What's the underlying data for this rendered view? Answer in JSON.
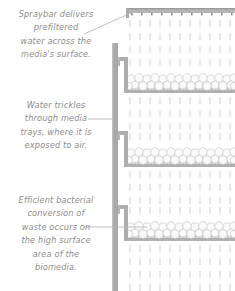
{
  "figure": {
    "background_color": "#ffffff",
    "line_color": "#a8a8a8",
    "text_color": "#8d8d8d",
    "media_fill_color": "#f2f2f2",
    "droplet_color": "#dcdcdc"
  },
  "captions": [
    {
      "id": "spraybar-caption",
      "text": "Spraybar delivers\nprefiltered\nwater across the\nmedia's surface."
    },
    {
      "id": "trickle-caption",
      "text": "Water trickles\nthrough media\ntrays, where it is\nexposed to air."
    },
    {
      "id": "bacteria-caption",
      "text": "Efficient bacterial\nconversion of\nwaste occurs on\nthe high surface\narea of the\nbiomedia."
    }
  ],
  "diagram": {
    "spraybar": {
      "label": "spraybar",
      "x": 126,
      "y": 8,
      "width": 109,
      "height": 5,
      "nozzle_count": 11
    },
    "wall": {
      "label": "vertical-wall",
      "x": 112,
      "y": 43,
      "width": 6,
      "height": 248
    },
    "trays": [
      {
        "label": "media-tray-1",
        "bracket_y": 57,
        "tray_x": 128,
        "tray_top": 64,
        "tray_bottom": 92,
        "media_rows": 2
      },
      {
        "label": "media-tray-2",
        "bracket_y": 131,
        "tray_x": 128,
        "tray_top": 138,
        "tray_bottom": 166,
        "media_rows": 2
      },
      {
        "label": "media-tray-3",
        "bracket_y": 205,
        "tray_x": 128,
        "tray_top": 212,
        "tray_bottom": 240,
        "media_rows": 2
      }
    ],
    "water_droplets": {
      "label": "water-droplets",
      "column_spacing": 10.2,
      "row_spacing": 13.5,
      "dash_length": 7,
      "dash_width": 1.3
    },
    "leaders": [
      {
        "label": "leader-spraybar",
        "type": "diagonal",
        "x1": 85,
        "y1": 33,
        "x2": 130,
        "y2": 13
      },
      {
        "label": "leader-trickle",
        "type": "horizontal",
        "x1": 88,
        "y1": 119,
        "x2": 116,
        "y2": 119
      },
      {
        "label": "leader-bacteria",
        "type": "horizontal",
        "x1": 85,
        "y1": 227,
        "x2": 146,
        "y2": 227
      }
    ]
  }
}
